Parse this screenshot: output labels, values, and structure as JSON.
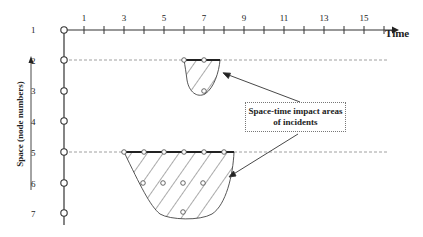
{
  "diagram": {
    "x_axis": {
      "label": "Time",
      "tick_labels": [
        "1",
        "3",
        "5",
        "7",
        "9",
        "11",
        "13",
        "15"
      ],
      "tick_label_values": [
        1,
        3,
        5,
        7,
        9,
        11,
        13,
        15
      ],
      "range": [
        0,
        16
      ]
    },
    "y_axis": {
      "label": "Space (node numbers)",
      "node_labels": [
        "1",
        "2",
        "3",
        "4",
        "5",
        "6",
        "7"
      ]
    },
    "callout": {
      "line1": "Space-time impact areas",
      "line2": "of incidents"
    },
    "incidents": [
      {
        "name": "incident-node-2",
        "start_node": 2,
        "time_span": [
          6,
          7.8
        ],
        "top_circles_t": [
          6,
          7
        ],
        "inner_circles": [
          {
            "node": 3,
            "t": 7
          }
        ]
      },
      {
        "name": "incident-node-5",
        "start_node": 5,
        "time_span": [
          3,
          8.5
        ],
        "top_circles_t": [
          3,
          4,
          5,
          6,
          7,
          8
        ],
        "inner_circles": [
          {
            "node": 6,
            "t": 4
          },
          {
            "node": 6,
            "t": 5
          },
          {
            "node": 6,
            "t": 6
          },
          {
            "node": 6,
            "t": 7
          },
          {
            "node": 7,
            "t": 6
          }
        ]
      }
    ],
    "colors": {
      "axis": "#333333",
      "dashed": "#888888",
      "hatch": "#444444"
    }
  }
}
